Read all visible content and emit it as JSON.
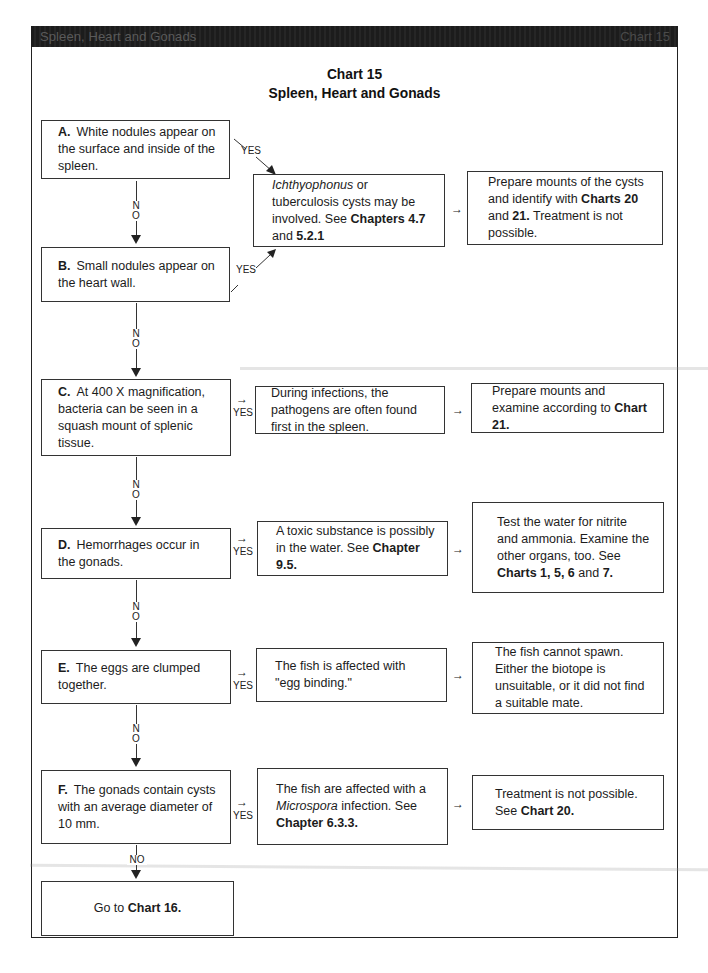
{
  "page_header": {
    "left": "Spleen, Heart and Gonads",
    "right": "Chart 15"
  },
  "title": {
    "line1": "Chart 15",
    "line2": "Spleen, Heart and Gonads"
  },
  "connectors": {
    "yes": "YES",
    "no_n": "N",
    "no_o": "O",
    "no": "NO",
    "right_arrow": "→"
  },
  "questions": [
    {
      "id": "A",
      "label": "A.",
      "text": "White nodules appear on the surface and inside of the spleen."
    },
    {
      "id": "B",
      "label": "B.",
      "text": "Small nodules appear on the heart wall."
    },
    {
      "id": "C",
      "label": "C.",
      "text": "At 400 X magnification, bacteria can be seen in a squash mount of splenic tissue."
    },
    {
      "id": "D",
      "label": "D.",
      "text": "Hemorrhages occur in the gonads."
    },
    {
      "id": "E",
      "label": "E.",
      "text": "The eggs are clumped together."
    },
    {
      "id": "F",
      "label": "F.",
      "text": "The gonads contain cysts with an average diameter of 10 mm."
    }
  ],
  "diagnoses": {
    "AB": {
      "italic": "Ichthyophonus",
      "text": " or tuberculosis cysts may be involved. See ",
      "bold1": "Chapters 4.7",
      "mid": " and ",
      "bold2": "5.2.1"
    },
    "C": {
      "text": "During infections, the pathogens are often found first in the spleen."
    },
    "D": {
      "text": "A toxic substance is possibly in the water. See ",
      "bold": "Chapter 9.5."
    },
    "E": {
      "text": "The fish is affected with \"egg binding.\""
    },
    "F": {
      "text1": "The fish are affected with a ",
      "italic": "Microspora",
      "text2": " infection. See ",
      "bold": "Chapter 6.3.3."
    }
  },
  "actions": {
    "AB": {
      "text1": "Prepare mounts of the cysts and identify with ",
      "bold1": "Charts 20",
      "mid": " and ",
      "bold2": "21.",
      "text2": " Treatment is not possible."
    },
    "C": {
      "text": "Prepare mounts and examine according to ",
      "bold": "Chart 21."
    },
    "D": {
      "text": "Test the water for nitrite and ammonia. Examine the other organs, too. See ",
      "bold1": "Charts 1, 5, 6",
      "mid": " and ",
      "bold2": "7."
    },
    "E": {
      "text": "The fish cannot spawn. Either the biotope is unsuitable, or it did not find a suitable mate."
    },
    "F": {
      "text": "Treatment is not possible. See ",
      "bold": "Chart 20."
    }
  },
  "final": {
    "text": "Go to ",
    "bold": "Chart 16."
  }
}
